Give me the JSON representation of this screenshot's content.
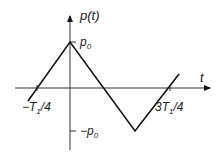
{
  "diagram": {
    "y_axis_label": "p(t)",
    "x_axis_label": "t",
    "labels": {
      "p0": "p",
      "p0_sub": "0",
      "neg_p0": "−p",
      "neg_p0_sub": "0",
      "neg_T1_4_pre": "−T",
      "neg_T1_4_sub": "1",
      "neg_T1_4_post": "/4",
      "three_T1_4_pre": "3T",
      "three_T1_4_sub": "1",
      "three_T1_4_post": "/4"
    },
    "colors": {
      "line": "#111111",
      "text": "#222222"
    }
  }
}
